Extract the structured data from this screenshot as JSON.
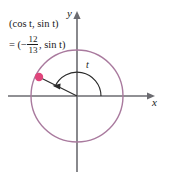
{
  "figure": {
    "background_color": "#ffffff"
  },
  "labels": {
    "point_label_line1": "(cos t, sin t)",
    "point_label_eq": "= (−",
    "fraction_numerator": "12",
    "fraction_denominator": "13",
    "point_label_rest": ", sin t)",
    "cos_text": "(cos ",
    "t1": "t",
    "comma_sin": ", sin ",
    "t2": "t",
    "close_paren": ")",
    "y_axis": "y",
    "x_axis": "x",
    "angle": "t"
  },
  "colors": {
    "circle": "#a97a9e",
    "point": "#e0457b",
    "axis": "#6b6b70",
    "radius_line": "#2a2a2a",
    "arc": "#2a2a2a",
    "text": "#1a1a1a"
  },
  "geometry": {
    "origin_x": 77,
    "origin_y": 96,
    "radius": 46,
    "point_x": 39,
    "point_y": 77,
    "cos_t": -0.923,
    "sin_t": 0.385,
    "angle_degrees": 157,
    "x_axis_start": 8,
    "x_axis_end": 150,
    "y_axis_top": 13,
    "y_axis_bottom": 172
  }
}
